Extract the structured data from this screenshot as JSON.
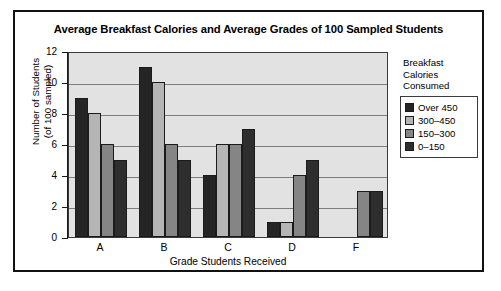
{
  "chart_data": {
    "type": "bar",
    "title": "Average Breakfast Calories and Average Grades of 100 Sampled Students",
    "xlabel": "Grade Students Received",
    "ylabel": "Number of Students (of 100 sampled)",
    "ylabel_line1": "Number of Students",
    "ylabel_line2": "(of 100 sampled)",
    "categories": [
      "A",
      "B",
      "C",
      "D",
      "F"
    ],
    "ylim": [
      0,
      12
    ],
    "yticks": [
      0,
      2,
      4,
      6,
      8,
      10,
      12
    ],
    "ytick_labels": [
      "0",
      "2",
      "4",
      "6",
      "8",
      "10",
      "12"
    ],
    "grid": true,
    "legend_position": "right",
    "legend_title": "Breakfast Calories Consumed",
    "legend_title_line1": "Breakfast",
    "legend_title_line2": "Calories",
    "legend_title_line3": "Consumed",
    "series": [
      {
        "name": "Over 450",
        "color": "#252525",
        "values": [
          9,
          11,
          4,
          1,
          0
        ]
      },
      {
        "name": "300–450",
        "color": "#b5b5b5",
        "values": [
          8,
          10,
          6,
          1,
          0
        ]
      },
      {
        "name": "150–300",
        "color": "#858585",
        "values": [
          6,
          6,
          6,
          4,
          3
        ]
      },
      {
        "name": "0–150",
        "color": "#2e2e2e",
        "values": [
          5,
          5,
          7,
          5,
          3
        ]
      }
    ]
  },
  "colors": {
    "plot_background": "#e2e2e2",
    "frame": "#111111",
    "gridline": "#7d7d7d",
    "axis": "#1a1a1a"
  }
}
